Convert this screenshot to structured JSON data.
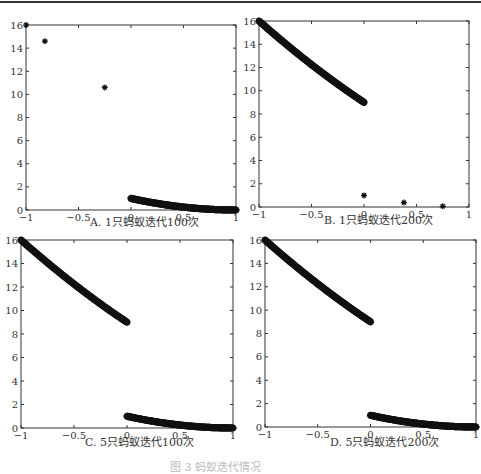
{
  "figure": {
    "caption_partial": "图 3  蚂蚁迭代情况"
  },
  "chart_data": [
    {
      "id": "A",
      "type": "scatter",
      "title": "A. 1只蚂蚁迭代100次",
      "xlabel": "",
      "ylabel": "",
      "xlim": [
        -1,
        1
      ],
      "ylim": [
        0,
        16
      ],
      "xticks": [
        "-1",
        "-0.5",
        "0",
        "0.5",
        "1"
      ],
      "yticks": [
        "0",
        "2",
        "4",
        "6",
        "8",
        "10",
        "12",
        "14",
        "16"
      ],
      "grid": false,
      "marker": "*",
      "series": [
        {
          "name": "isolated points",
          "x": [
            -1.0,
            -0.82,
            -0.25
          ],
          "y": [
            16.0,
            14.6,
            10.6
          ]
        },
        {
          "name": "right branch",
          "x": [
            0.0,
            0.1,
            0.2,
            0.3,
            0.4,
            0.5,
            0.6,
            0.7,
            0.8,
            0.9,
            1.0
          ],
          "y": [
            1.0,
            0.81,
            0.64,
            0.49,
            0.36,
            0.25,
            0.16,
            0.09,
            0.04,
            0.01,
            0.0
          ]
        }
      ]
    },
    {
      "id": "B",
      "type": "scatter",
      "title": "B. 1只蚂蚁迭代200次",
      "xlim": [
        -1,
        1
      ],
      "ylim": [
        0,
        16
      ],
      "xticks": [
        "-1",
        "-0.5",
        "0",
        "0.5",
        "1"
      ],
      "yticks": [
        "0",
        "2",
        "4",
        "6",
        "8",
        "10",
        "12",
        "14",
        "16"
      ],
      "grid": false,
      "marker": "*",
      "series": [
        {
          "name": "left branch",
          "x": [
            -1.0,
            -0.9,
            -0.8,
            -0.7,
            -0.6,
            -0.5,
            -0.4,
            -0.3,
            -0.2,
            -0.1,
            0.0
          ],
          "y": [
            16.0,
            15.21,
            14.44,
            13.69,
            12.96,
            12.25,
            11.56,
            10.89,
            10.24,
            9.61,
            9.0
          ]
        },
        {
          "name": "isolated points",
          "x": [
            0.0,
            0.38,
            0.75
          ],
          "y": [
            1.0,
            0.38,
            0.06
          ]
        }
      ]
    },
    {
      "id": "C",
      "type": "scatter",
      "title": "C. 5只蚂蚁迭代100次",
      "xlim": [
        -1,
        1
      ],
      "ylim": [
        0,
        16
      ],
      "xticks": [
        "-1",
        "-0.5",
        "0",
        "0.5",
        "1"
      ],
      "yticks": [
        "0",
        "2",
        "4",
        "6",
        "8",
        "10",
        "12",
        "14",
        "16"
      ],
      "grid": false,
      "marker": "*",
      "series": [
        {
          "name": "left branch",
          "x": [
            -1.0,
            -0.9,
            -0.8,
            -0.7,
            -0.6,
            -0.5,
            -0.4,
            -0.3,
            -0.2,
            -0.1,
            0.0
          ],
          "y": [
            16.0,
            15.21,
            14.44,
            13.69,
            12.96,
            12.25,
            11.56,
            10.89,
            10.24,
            9.61,
            9.0
          ]
        },
        {
          "name": "right branch",
          "x": [
            0.0,
            0.1,
            0.2,
            0.3,
            0.4,
            0.5,
            0.6,
            0.7,
            0.8,
            0.9,
            1.0
          ],
          "y": [
            1.0,
            0.81,
            0.64,
            0.49,
            0.36,
            0.25,
            0.16,
            0.09,
            0.04,
            0.01,
            0.0
          ]
        }
      ]
    },
    {
      "id": "D",
      "type": "scatter",
      "title": "D. 5只蚂蚁迭代200次",
      "xlim": [
        -1,
        1
      ],
      "ylim": [
        0,
        16
      ],
      "xticks": [
        "-1",
        "-0.5",
        "0",
        "0.5",
        "1"
      ],
      "yticks": [
        "0",
        "2",
        "4",
        "6",
        "8",
        "10",
        "12",
        "14",
        "16"
      ],
      "grid": false,
      "marker": "*",
      "series": [
        {
          "name": "left branch",
          "x": [
            -1.0,
            -0.9,
            -0.8,
            -0.7,
            -0.6,
            -0.5,
            -0.4,
            -0.3,
            -0.2,
            -0.1,
            0.0
          ],
          "y": [
            16.0,
            15.21,
            14.44,
            13.69,
            12.96,
            12.25,
            11.56,
            10.89,
            10.24,
            9.61,
            9.0
          ]
        },
        {
          "name": "right branch",
          "x": [
            0.0,
            0.1,
            0.2,
            0.3,
            0.4,
            0.5,
            0.6,
            0.7,
            0.8,
            0.9,
            1.0
          ],
          "y": [
            1.0,
            0.81,
            0.64,
            0.49,
            0.36,
            0.25,
            0.16,
            0.09,
            0.04,
            0.01,
            0.0
          ]
        }
      ]
    }
  ]
}
